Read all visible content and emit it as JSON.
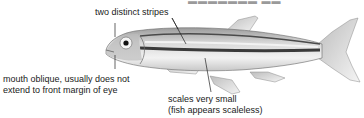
{
  "diagram": {
    "top_clipped_text": "▬▬▬▬▬▬▬ ▬▬",
    "callouts": [
      {
        "id": "stripes",
        "text": "two distinct stripes"
      },
      {
        "id": "mouth",
        "lines": [
          "mouth oblique, usually does not",
          "extend to front margin of eye"
        ]
      },
      {
        "id": "scales",
        "lines": [
          "scales very small",
          "(fish appears scaleless)"
        ]
      }
    ],
    "colors": {
      "text": "#1a1a1a",
      "line": "#222222",
      "stripe": "#3a3a3a",
      "body": "#e8e8e8"
    }
  }
}
